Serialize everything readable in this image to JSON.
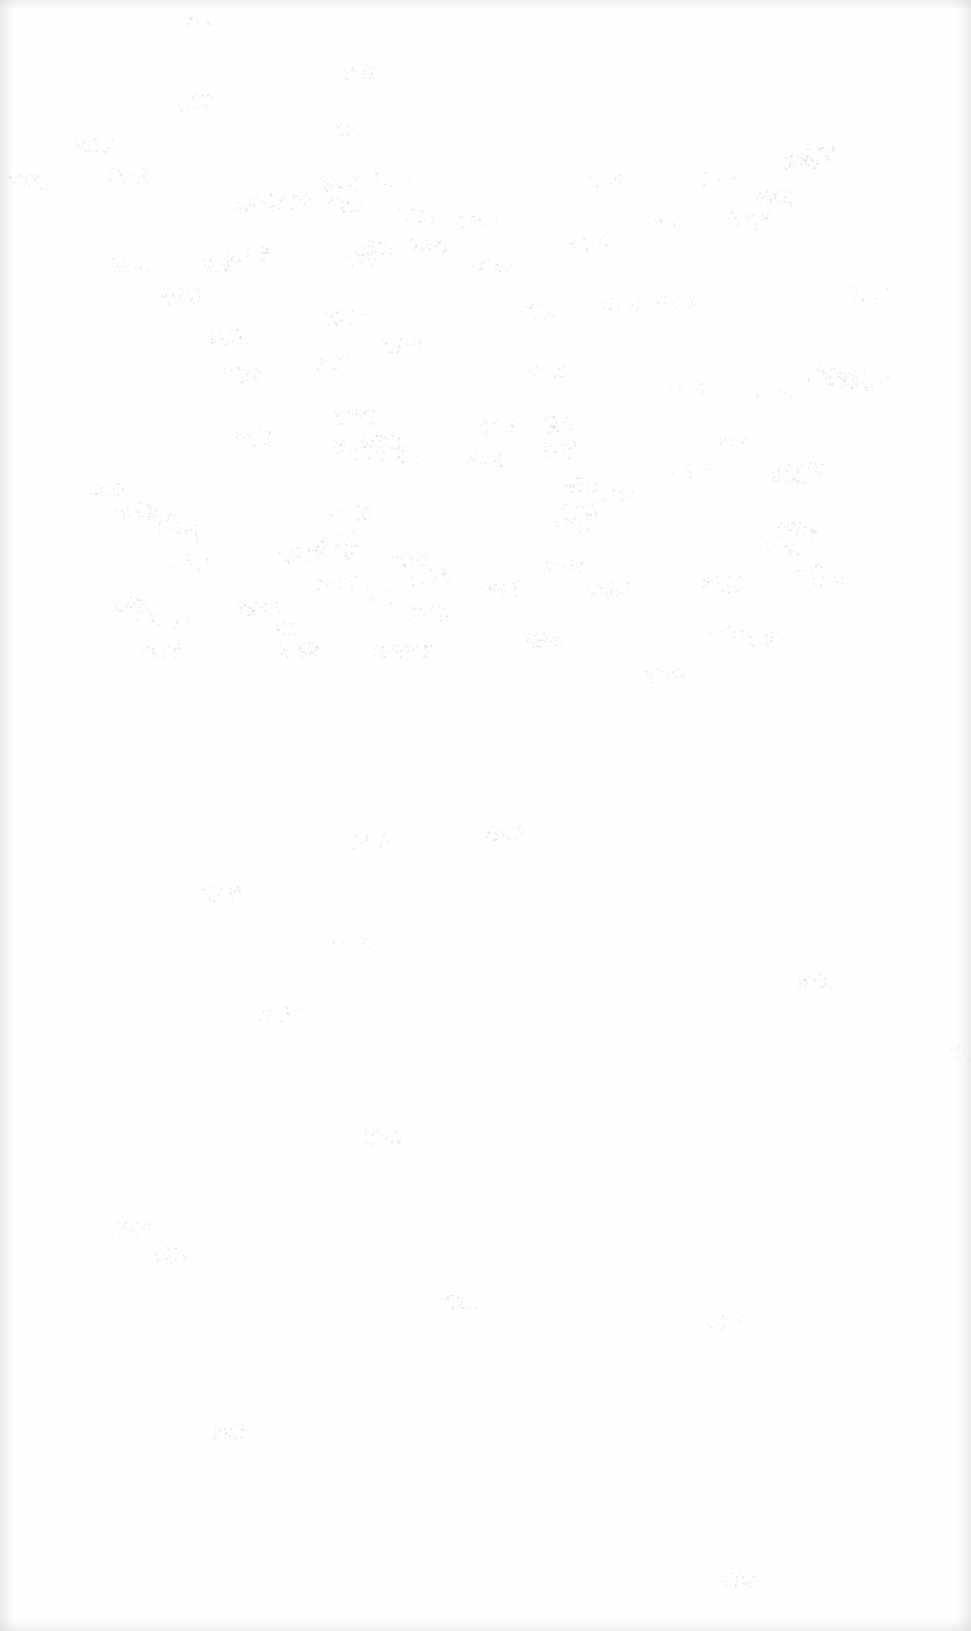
{
  "document": {
    "type": "scanned-page",
    "content": "",
    "background_color": "#fefefe",
    "speckle_color": "#c8c8c8"
  }
}
